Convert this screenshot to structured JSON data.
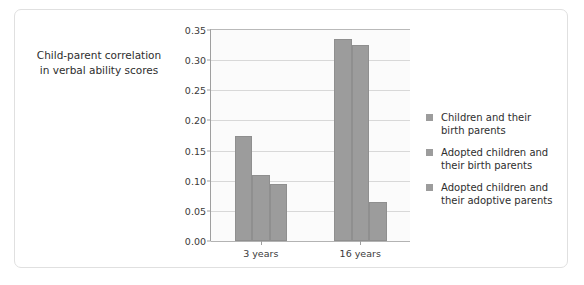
{
  "chart_data": {
    "type": "bar",
    "title": "",
    "xlabel": "",
    "ylabel": "Child-parent correlation in verbal ability scores",
    "ylabel_line1": "Child-parent correlation",
    "ylabel_line2": "in verbal ability scores",
    "categories": [
      "3 years",
      "16 years"
    ],
    "series": [
      {
        "name": "Children and their birth parents",
        "name_line1": "Children and their",
        "name_line2": "birth parents",
        "values": [
          0.175,
          0.335
        ],
        "color": "#9c9c9c"
      },
      {
        "name": "Adopted children and their birth parents",
        "name_line1": "Adopted children and",
        "name_line2": "their birth parents",
        "values": [
          0.11,
          0.325
        ],
        "color": "#9c9c9c"
      },
      {
        "name": "Adopted children and their adoptive parents",
        "name_line1": "Adopted children and",
        "name_line2": "their adoptive parents",
        "values": [
          0.095,
          0.065
        ],
        "color": "#9c9c9c"
      }
    ],
    "ylim": [
      0.0,
      0.35
    ],
    "yticks": [
      "0.00",
      "0.05",
      "0.10",
      "0.15",
      "0.20",
      "0.25",
      "0.30",
      "0.35"
    ],
    "ytick_values": [
      0.0,
      0.05,
      0.1,
      0.15,
      0.2,
      0.25,
      0.3,
      0.35
    ],
    "grid": true,
    "legend_position": "right",
    "plot_background": "#fbfbfb",
    "gridline_color": "#d8d8d8",
    "bar_color": "#9c9c9c"
  }
}
